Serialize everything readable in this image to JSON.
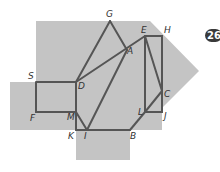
{
  "figure": {
    "fill_color": "#c4c4c4",
    "line_color": "#555555",
    "badge": {
      "text": "26"
    },
    "labels": {
      "G": "G",
      "A": "A",
      "E": "E",
      "H": "H",
      "S": "S",
      "D": "D",
      "F": "F",
      "M": "M",
      "K": "K",
      "I": "I",
      "B": "B",
      "L": "L",
      "C": "C",
      "J": "J"
    }
  }
}
